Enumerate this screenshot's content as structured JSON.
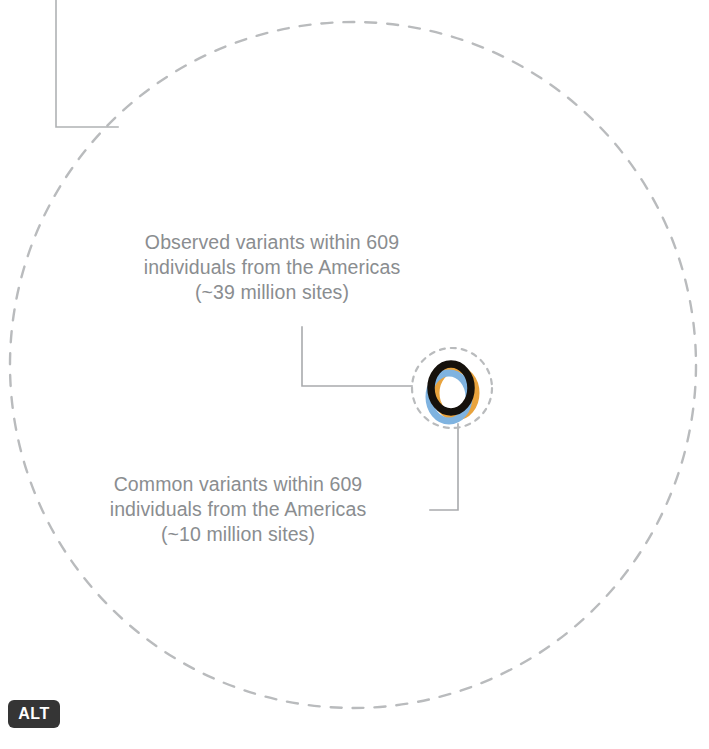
{
  "figure": {
    "background_color": "#ffffff",
    "dash_color": "#b9bbbd",
    "leader_color": "#a9abad",
    "text_color": "#8a8d90",
    "callouts": [
      {
        "id": "observed",
        "lines": [
          "Observed variants within 609",
          "individuals from the Americas",
          "(~39 million sites)"
        ]
      },
      {
        "id": "common",
        "lines": [
          "Common variants within 609",
          "individuals from the Americas",
          "(~10 million sites)"
        ]
      }
    ],
    "rings": {
      "outer_dashed_circle": {
        "center_x": 353,
        "center_y": 365,
        "radius": 343,
        "style": "dashed",
        "color": "#b9bbbd"
      },
      "inner_dashed_circle": {
        "center_x": 452,
        "center_y": 388,
        "radius": 40,
        "style": "dashed",
        "color": "#b9bbbd"
      },
      "core_rings": [
        {
          "name": "orange-ring",
          "color": "#e8a33d",
          "center_x": 455,
          "center_y": 392,
          "rx": 20,
          "ry": 24
        },
        {
          "name": "blue-ring",
          "color": "#7fb3e0",
          "center_x": 449,
          "center_y": 396,
          "rx": 20,
          "ry": 24
        },
        {
          "name": "black-ring",
          "color": "#15110c",
          "center_x": 451,
          "center_y": 388,
          "rx": 20,
          "ry": 24
        }
      ]
    },
    "leaders": [
      {
        "name": "top-left-bracket",
        "points": "56,0 56,127 118,127"
      },
      {
        "name": "observed-leader",
        "points": "302,327 302,386 412,386"
      },
      {
        "name": "common-leader",
        "points": "430,510 458,510 458,422"
      }
    ]
  },
  "badge": {
    "label": "ALT"
  }
}
